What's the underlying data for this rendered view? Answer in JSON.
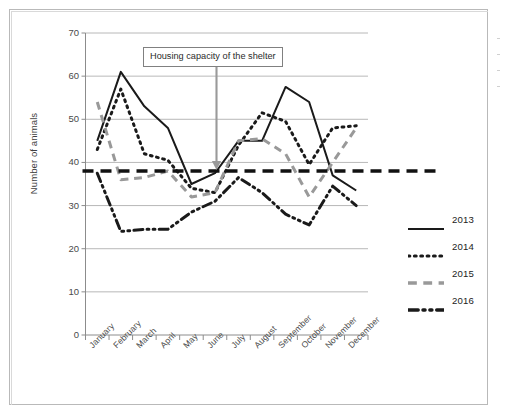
{
  "chart_data": {
    "type": "line",
    "title": "",
    "xlabel": "",
    "ylabel": "Number of animals",
    "ylim": [
      0,
      70
    ],
    "ytick_step": 10,
    "yticks": [
      0,
      10,
      20,
      30,
      40,
      50,
      60,
      70
    ],
    "grid": "horizontal",
    "legend_position": "right",
    "categories": [
      "January",
      "February",
      "March",
      "April",
      "May",
      "June",
      "July",
      "August",
      "September",
      "October",
      "November",
      "December"
    ],
    "series": [
      {
        "name": "2013",
        "style": "solid",
        "color": "#1a1a1a",
        "values": [
          45,
          61,
          53,
          48,
          35,
          37.5,
          45,
          45,
          57.5,
          54,
          37,
          33.5
        ]
      },
      {
        "name": "2014",
        "style": "dotted",
        "color": "#1a1a1a",
        "values": [
          43,
          57,
          42,
          40.5,
          34,
          33,
          44,
          51.5,
          49.5,
          39.5,
          48,
          48.5
        ]
      },
      {
        "name": "2015",
        "style": "dashed",
        "color": "#999999",
        "values": [
          54,
          36,
          36.5,
          38,
          32,
          33,
          45,
          45.5,
          42,
          32,
          40,
          48
        ]
      },
      {
        "name": "2016",
        "style": "dashdot",
        "color": "#1a1a1a",
        "values": [
          37.5,
          24,
          24.5,
          24.5,
          28.5,
          31,
          36.5,
          33,
          28,
          25.5,
          34.5,
          30
        ]
      }
    ],
    "reference_line": {
      "label": "Housing capacity of the shelter",
      "value": 38,
      "style": "dashed",
      "color": "#111111"
    },
    "annotation": {
      "text": "Housing capacity of the shelter",
      "arrow_color": "#9a9a9a",
      "points_to_value": 38,
      "points_to_category": "June"
    }
  },
  "legend": {
    "items": [
      {
        "label": "2013"
      },
      {
        "label": "2014"
      },
      {
        "label": "2015"
      },
      {
        "label": "2016"
      }
    ]
  },
  "axes": {
    "y_title": "Number of animals",
    "y_labels": [
      "70",
      "60",
      "50",
      "40",
      "30",
      "20",
      "10",
      "0"
    ],
    "x_labels": [
      "January",
      "February",
      "March",
      "April",
      "May",
      "June",
      "July",
      "August",
      "September",
      "October",
      "November",
      "December"
    ]
  }
}
